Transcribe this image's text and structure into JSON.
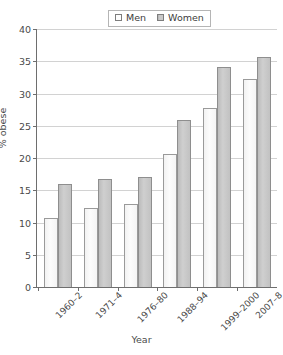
{
  "chart_data": {
    "type": "bar",
    "title": "",
    "xlabel": "Year",
    "ylabel": "% obese",
    "ylim": [
      0,
      40
    ],
    "yticks": [
      0,
      5,
      10,
      15,
      20,
      25,
      30,
      35,
      40
    ],
    "grid": true,
    "legend_position": "top-center",
    "categories": [
      "1960–2",
      "1971–4",
      "1976–80",
      "1988–94",
      "1999–2000",
      "2007–8"
    ],
    "series": [
      {
        "name": "Men",
        "values": [
          10.7,
          12.2,
          12.8,
          20.6,
          27.8,
          32.3
        ],
        "color": "#fbfbfb"
      },
      {
        "name": "Women",
        "values": [
          16.0,
          16.7,
          17.1,
          25.9,
          34.1,
          35.6
        ],
        "color": "#c9c9c9"
      }
    ]
  },
  "legend": {
    "items": [
      {
        "label": "Men"
      },
      {
        "label": "Women"
      }
    ]
  },
  "axes": {
    "y_title": "% obese",
    "x_title": "Year"
  }
}
